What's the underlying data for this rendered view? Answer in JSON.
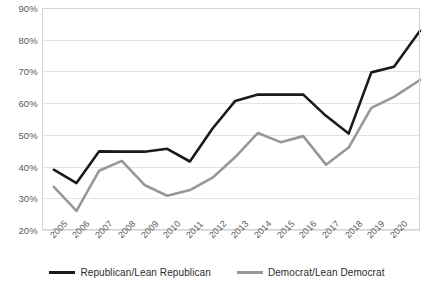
{
  "chart_data": {
    "type": "line",
    "title": "",
    "subtitle": "",
    "xlabel": "",
    "ylabel": "",
    "grid": true,
    "legend_position": "bottom",
    "categories": [
      "2005",
      "2006",
      "2007",
      "2008",
      "2009",
      "2010",
      "2011",
      "2012",
      "2013",
      "2014",
      "2015",
      "2016",
      "2017",
      "2018",
      "2019",
      "2020"
    ],
    "x": [
      2005,
      2006,
      2007,
      2008,
      2009,
      2010,
      2011,
      2012,
      2013,
      2014,
      2015,
      2016,
      2017,
      2018,
      2019,
      2020
    ],
    "ylim": [
      20,
      90
    ],
    "ytick_values": [
      20,
      30,
      40,
      50,
      60,
      70,
      80,
      90
    ],
    "ytick_labels": [
      "20%",
      "30%",
      "40%",
      "50%",
      "60%",
      "70%",
      "80%",
      "90%"
    ],
    "xtick_labels": [
      "2005",
      "2006",
      "2007",
      "2008",
      "2009",
      "2010",
      "2011",
      "2012",
      "2013",
      "2014",
      "2015",
      "2016",
      "2017",
      "2018",
      "2019",
      "2020"
    ],
    "series": [
      {
        "name": "Republican/Lean Republican",
        "color": "#1a1a1a",
        "width": 2.6,
        "values": [
          39.0,
          34.8,
          44.8,
          44.7,
          44.7,
          45.6,
          41.6,
          52.0,
          60.7,
          62.7,
          62.7,
          62.7,
          56.0,
          50.4,
          69.7,
          71.5
        ],
        "final_value": 82.8
      },
      {
        "name": "Democrat/Lean Democrat",
        "color": "#989898",
        "width": 2.6,
        "values": [
          33.6,
          26.0,
          38.7,
          41.8,
          34.2,
          30.8,
          32.6,
          36.5,
          43.0,
          50.6,
          47.7,
          49.6,
          40.6,
          46.0,
          58.5,
          62.0
        ],
        "final_value": 67.3
      }
    ]
  },
  "legend": {
    "entries": [
      {
        "label": "Republican/Lean Republican",
        "color": "#1a1a1a"
      },
      {
        "label": "Democrat/Lean Democrat",
        "color": "#989898"
      }
    ]
  },
  "colors": {
    "republican": "#1a1a1a",
    "democrat": "#989898",
    "grid": "#e3e3e3",
    "border": "#d4d4d4",
    "axis_text": "#5a5a5a",
    "legend_text": "#2b2b2b",
    "background": "#ffffff"
  }
}
